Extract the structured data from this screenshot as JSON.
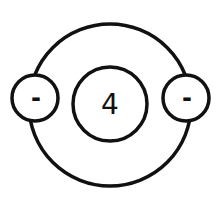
{
  "diagram": {
    "type": "atom-model",
    "stroke_color": "#111111",
    "background": "#ffffff",
    "nucleus": {
      "label": "4"
    },
    "orbit": {
      "count": 1
    },
    "electrons": [
      {
        "position": "left",
        "label": "-"
      },
      {
        "position": "right",
        "label": "-"
      }
    ]
  }
}
